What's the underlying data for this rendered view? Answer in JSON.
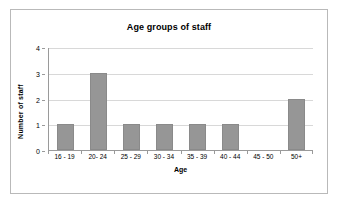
{
  "chart_data": {
    "type": "bar",
    "title": "Age groups of staff",
    "xlabel": "Age",
    "ylabel": "Number of staff",
    "categories": [
      "16 - 19",
      "20- 24",
      "25 - 29",
      "30 - 34",
      "35 - 39",
      "40 - 44",
      "45 - 50",
      "50+"
    ],
    "values": [
      1,
      3,
      1,
      1,
      1,
      1,
      0,
      2
    ],
    "ylim": [
      0,
      4
    ],
    "yticks": [
      0,
      1,
      2,
      3,
      4
    ],
    "ytick_labels": [
      "0",
      "1",
      "2",
      "3",
      "4"
    ],
    "grid": true,
    "legend": false,
    "bar_color": "#969696",
    "gridline_color": "#d8d8d8",
    "axis_color": "#9a9a9a",
    "plot_background": "#ffffff",
    "frame_border_color": "#b9b9b9"
  }
}
